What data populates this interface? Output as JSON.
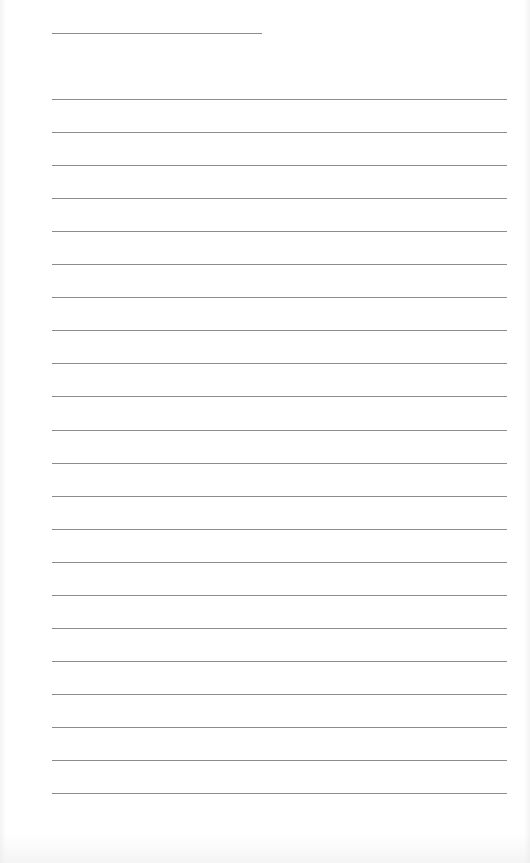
{
  "document": {
    "type": "lined-paper",
    "background_color": "#ffffff",
    "line_color": "#8c8c8c",
    "header_line": {
      "label": "",
      "x": 52,
      "y": 33,
      "width": 210
    },
    "ruled_lines": {
      "count": 22,
      "x": 52,
      "first_y": 99,
      "spacing": 33.05,
      "width": 455
    }
  }
}
